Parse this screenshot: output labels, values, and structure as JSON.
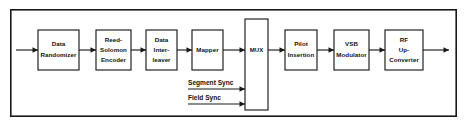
{
  "diagram": {
    "border_color": "#1a1a1a",
    "background_color": "#ffffff",
    "line_color": "#1a1a1a",
    "blocks": [
      {
        "id": "data-randomizer",
        "lines": [
          "Data",
          "Randomizer"
        ],
        "x": 38,
        "y": 30,
        "w": 41,
        "h": 40
      },
      {
        "id": "reed-solomon-encoder",
        "lines": [
          "Reed-",
          "Solomon",
          "Encoder"
        ],
        "x": 96,
        "y": 30,
        "w": 35,
        "h": 40
      },
      {
        "id": "data-interleaver",
        "lines": [
          "Data",
          "Inter-",
          "leaver"
        ],
        "x": 146,
        "y": 30,
        "w": 31,
        "h": 40
      },
      {
        "id": "mapper",
        "lines": [
          "Mapper"
        ],
        "x": 192,
        "y": 30,
        "w": 31,
        "h": 40
      },
      {
        "id": "mux",
        "lines": [
          "MUX"
        ],
        "x": 245,
        "y": 19,
        "w": 23,
        "h": 91
      },
      {
        "id": "pilot-insertion",
        "lines": [
          "Pilot",
          "Insertion"
        ],
        "x": 285,
        "y": 30,
        "w": 32,
        "h": 40
      },
      {
        "id": "vsb-modulator",
        "lines": [
          "VSB",
          "Modulator"
        ],
        "x": 334,
        "y": 30,
        "w": 35,
        "h": 40
      },
      {
        "id": "rf-up-converter",
        "lines": [
          "RF",
          "Up-",
          "Converter"
        ],
        "x": 385,
        "y": 30,
        "w": 38,
        "h": 40
      }
    ],
    "signals": [
      {
        "id": "segment-sync",
        "label": "Segment Sync",
        "label_x": 188,
        "label_y": 85,
        "line_y": 89
      },
      {
        "id": "field-sync",
        "label": "Field Sync",
        "label_x": 188,
        "label_y": 100,
        "line_y": 104
      }
    ],
    "input_arrow": {
      "id": "input-signal-arrow",
      "x1": 16,
      "x2": 38,
      "y": 50
    },
    "output_arrow": {
      "id": "output-signal-arrow",
      "x1": 423,
      "x2": 449,
      "y": 50
    },
    "frame": {
      "x": 10,
      "y": 9,
      "w": 447,
      "h": 108
    }
  }
}
